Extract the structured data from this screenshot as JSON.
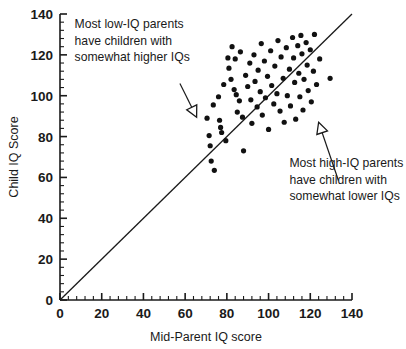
{
  "chart_data": {
    "type": "scatter",
    "title": "",
    "xlabel": "Mid-Parent IQ score",
    "ylabel": "Child IQ Score",
    "xlim": [
      0,
      140
    ],
    "ylim": [
      0,
      140
    ],
    "xticks": [
      0,
      20,
      40,
      60,
      80,
      100,
      120,
      140
    ],
    "yticks": [
      0,
      20,
      40,
      60,
      80,
      100,
      120,
      140
    ],
    "xtick_labels": [
      "0",
      "20",
      "40",
      "60",
      "80",
      "100",
      "120",
      "140"
    ],
    "ytick_labels": [
      "0",
      "20",
      "40",
      "60",
      "80",
      "100",
      "120",
      "140"
    ],
    "minor_ticks_per_interval": 4,
    "grid": false,
    "legend": false,
    "reference_line": {
      "name": "identity-line",
      "equation": "y = x",
      "from": [
        0,
        0
      ],
      "to": [
        140,
        140
      ]
    },
    "series": [
      {
        "name": "parent-child-iq",
        "marker": "filled-circle",
        "color": "#111111",
        "points": [
          [
            70.5,
            89.0
          ],
          [
            71.5,
            80.5
          ],
          [
            72.0,
            75.5
          ],
          [
            72.5,
            68.0
          ],
          [
            73.5,
            95.5
          ],
          [
            74.0,
            63.5
          ],
          [
            76.0,
            99.5
          ],
          [
            76.5,
            88.0
          ],
          [
            77.0,
            84.5
          ],
          [
            77.5,
            82.0
          ],
          [
            78.5,
            105.5
          ],
          [
            79.5,
            78.0
          ],
          [
            80.5,
            118.5
          ],
          [
            81.0,
            113.5
          ],
          [
            82.0,
            108.0
          ],
          [
            82.5,
            124.0
          ],
          [
            83.5,
            103.0
          ],
          [
            84.0,
            118.0
          ],
          [
            84.5,
            100.5
          ],
          [
            85.0,
            92.0
          ],
          [
            86.0,
            97.5
          ],
          [
            86.5,
            121.5
          ],
          [
            87.5,
            89.5
          ],
          [
            88.0,
            73.0
          ],
          [
            89.0,
            110.0
          ],
          [
            90.0,
            104.5
          ],
          [
            91.0,
            116.0
          ],
          [
            91.5,
            98.0
          ],
          [
            92.0,
            86.5
          ],
          [
            93.0,
            120.0
          ],
          [
            93.5,
            107.0
          ],
          [
            94.5,
            94.5
          ],
          [
            95.0,
            112.5
          ],
          [
            96.0,
            102.0
          ],
          [
            96.5,
            125.5
          ],
          [
            97.0,
            90.5
          ],
          [
            98.0,
            117.0
          ],
          [
            98.5,
            99.0
          ],
          [
            99.5,
            109.5
          ],
          [
            100.0,
            83.5
          ],
          [
            101.0,
            122.0
          ],
          [
            101.5,
            105.0
          ],
          [
            102.5,
            96.0
          ],
          [
            103.0,
            114.5
          ],
          [
            104.0,
            101.0
          ],
          [
            104.5,
            127.0
          ],
          [
            105.5,
            92.5
          ],
          [
            106.0,
            119.0
          ],
          [
            107.0,
            108.5
          ],
          [
            107.5,
            87.0
          ],
          [
            108.5,
            123.5
          ],
          [
            109.0,
            100.0
          ],
          [
            110.0,
            113.0
          ],
          [
            110.5,
            95.0
          ],
          [
            111.5,
            128.5
          ],
          [
            112.0,
            118.5
          ],
          [
            112.5,
            106.5
          ],
          [
            113.0,
            88.5
          ],
          [
            114.0,
            124.5
          ],
          [
            114.5,
            111.0
          ],
          [
            115.0,
            99.5
          ],
          [
            115.5,
            129.5
          ],
          [
            116.0,
            120.5
          ],
          [
            116.5,
            93.0
          ],
          [
            117.0,
            108.0
          ],
          [
            118.0,
            126.0
          ],
          [
            118.5,
            115.0
          ],
          [
            119.0,
            102.5
          ],
          [
            120.0,
            122.5
          ],
          [
            120.5,
            97.0
          ],
          [
            121.5,
            112.0
          ],
          [
            122.0,
            130.0
          ],
          [
            123.0,
            105.5
          ],
          [
            124.5,
            118.0
          ],
          [
            129.5,
            108.5
          ]
        ]
      }
    ],
    "annotations": [
      {
        "name": "low-iq-annotation",
        "lines": [
          "Most low-IQ parents",
          "have children with",
          "somewhat higher IQs"
        ],
        "text_anchor": [
          7.0,
          133.0
        ],
        "arrow_from": [
          57.5,
          106.0
        ],
        "arrow_to": [
          65.5,
          89.5
        ],
        "arrow_direction": "down-left"
      },
      {
        "name": "high-iq-annotation",
        "lines": [
          "Most high-IQ parents",
          "have children with",
          "somewhat lower IQs"
        ],
        "text_anchor": [
          110.0,
          65.0
        ],
        "arrow_from": [
          133.5,
          58.5
        ],
        "arrow_to": [
          124.0,
          87.0
        ],
        "arrow_direction": "up-left"
      }
    ]
  }
}
